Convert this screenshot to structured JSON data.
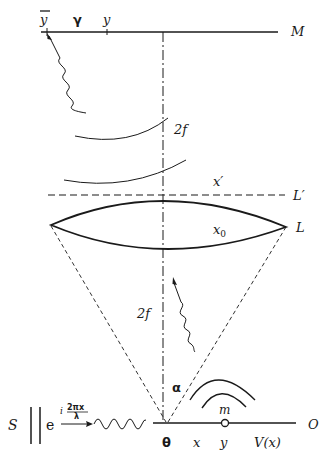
{
  "labels": {
    "y_bar": "y",
    "gamma": "γ",
    "y_top": "y",
    "M": "M",
    "two_f_top": "2f",
    "x_prime": "x′",
    "L_prime": "L′",
    "x0_base": "x",
    "x0_sub": "0",
    "L": "L",
    "two_f_bottom": "2f",
    "alpha": "α",
    "m": "m",
    "S": "S",
    "e": "e",
    "exp_i": "i",
    "exp_num": "2πx",
    "exp_den": "λ",
    "O": "O",
    "theta": "θ",
    "x_bottom": "x",
    "y_bottom": "y",
    "V_x": "V(x)"
  },
  "colors": {
    "ink": "#1a1a1a",
    "background": "#ffffff"
  }
}
